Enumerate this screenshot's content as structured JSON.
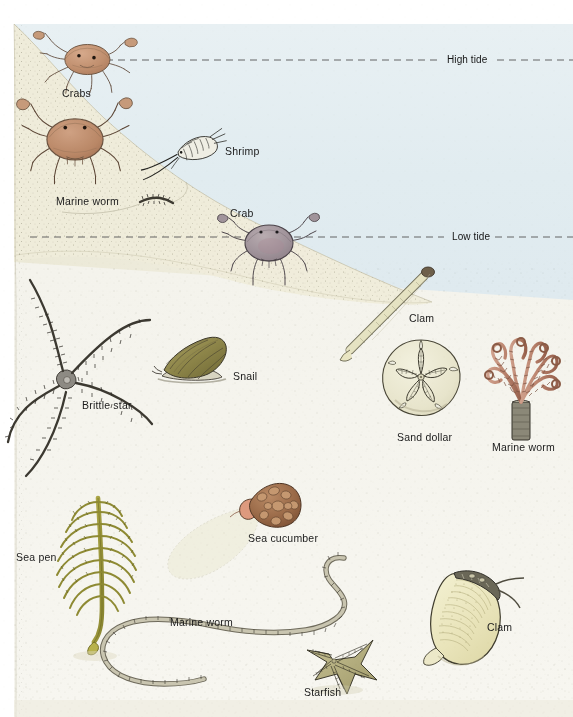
{
  "figure": {
    "water_color": "#e3edf1",
    "sand_color": "#f5f4ee",
    "slope_sand_color": "#eceadb",
    "label_color": "#1b1b1b",
    "tide_line_color": "#4a4a4a"
  },
  "tide_lines": [
    {
      "id": "high-tide",
      "label": "High tide",
      "y": 60,
      "label_x": 447
    },
    {
      "id": "low-tide",
      "label": "Low tide",
      "y": 237,
      "label_x": 452
    }
  ],
  "organisms": [
    {
      "id": "crabs",
      "label": "Crabs",
      "x": 62,
      "y": 88,
      "zone": "upper-intertidal"
    },
    {
      "id": "shrimp",
      "label": "Shrimp",
      "x": 225,
      "y": 146,
      "zone": "intertidal"
    },
    {
      "id": "marine-worm-1",
      "label": "Marine worm",
      "x": 56,
      "y": 196,
      "zone": "intertidal"
    },
    {
      "id": "crab-single",
      "label": "Crab",
      "x": 230,
      "y": 208,
      "zone": "low-tide"
    },
    {
      "id": "clam-upper",
      "label": "Clam",
      "x": 409,
      "y": 313,
      "zone": "subtidal"
    },
    {
      "id": "brittle-star",
      "label": "Brittle star",
      "x": 82,
      "y": 400,
      "zone": "subtidal"
    },
    {
      "id": "snail",
      "label": "Snail",
      "x": 233,
      "y": 371,
      "zone": "subtidal"
    },
    {
      "id": "sand-dollar",
      "label": "Sand dollar",
      "x": 397,
      "y": 432,
      "zone": "subtidal"
    },
    {
      "id": "marine-worm-2",
      "label": "Marine worm",
      "x": 492,
      "y": 442,
      "zone": "subtidal"
    },
    {
      "id": "sea-pen",
      "label": "Sea pen",
      "x": 16,
      "y": 552,
      "zone": "deep-subtidal"
    },
    {
      "id": "sea-cucumber",
      "label": "Sea cucumber",
      "x": 248,
      "y": 533,
      "zone": "deep-subtidal"
    },
    {
      "id": "marine-worm-3",
      "label": "Marine worm",
      "x": 170,
      "y": 617,
      "zone": "deep-subtidal"
    },
    {
      "id": "starfish",
      "label": "Starfish",
      "x": 304,
      "y": 687,
      "zone": "deep-subtidal"
    },
    {
      "id": "clam-lower",
      "label": "Clam",
      "x": 487,
      "y": 622,
      "zone": "deep-subtidal"
    }
  ]
}
